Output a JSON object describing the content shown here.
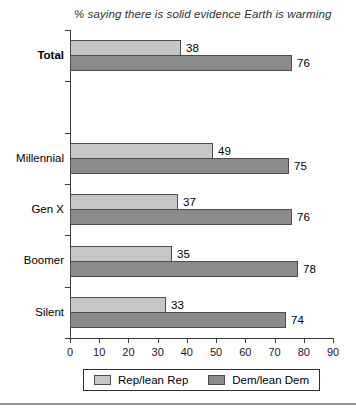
{
  "title": "% saying there is solid evidence Earth is warming",
  "chart_data": {
    "type": "bar",
    "orientation": "horizontal",
    "title": "% saying there is solid evidence Earth is warming",
    "categories": [
      "Total",
      "Millennial",
      "Gen X",
      "Boomer",
      "Silent"
    ],
    "bold_categories": [
      "Total"
    ],
    "series": [
      {
        "name": "Rep/lean Rep",
        "color": "#c6c6c6",
        "values": [
          38,
          49,
          37,
          35,
          33
        ]
      },
      {
        "name": "Dem/lean Dem",
        "color": "#8b8b8b",
        "values": [
          76,
          75,
          76,
          78,
          74
        ]
      }
    ],
    "xlim": [
      0,
      90
    ],
    "xticks": [
      0,
      10,
      20,
      30,
      40,
      50,
      60,
      70,
      80,
      90
    ],
    "grid": false,
    "value_labels": true,
    "legend_position": "bottom",
    "total_slots": 6,
    "group_slots": [
      0,
      2,
      3,
      4,
      5
    ]
  },
  "legend": {
    "items": [
      {
        "label": "Rep/lean Rep"
      },
      {
        "label": "Dem/lean Dem"
      }
    ]
  },
  "colors": {
    "rep_bar": "#c6c6c6",
    "dem_bar": "#8b8b8b",
    "bar_border": "#4d4d4d",
    "axis": "#3c3c3c",
    "text": "#2e2e2e",
    "divider": "#969696"
  }
}
